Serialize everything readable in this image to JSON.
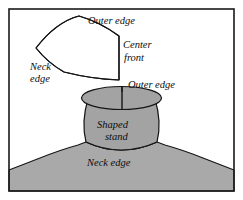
{
  "figure": {
    "background_color": "#ffffff",
    "border_color": "#1a1a1a",
    "ink_color": "#141414",
    "garment_fill": "#a9a9a9",
    "stand_fill": "#a3a3a3",
    "pattern_fill": "#ffffff"
  },
  "pattern_piece": {
    "name": "flat collar pattern piece",
    "labels": {
      "outer_edge": "Outer edge",
      "center_front_line1": "Center",
      "center_front_line2": "front",
      "neck_edge_line1": "Neck",
      "neck_edge_line2": "edge"
    }
  },
  "garment": {
    "name": "garment with shaped stand collar",
    "labels": {
      "outer_edge": "Outer edge",
      "shaped_stand_line1": "Shaped",
      "shaped_stand_line2": "stand",
      "neck_edge": "Neck edge"
    }
  }
}
